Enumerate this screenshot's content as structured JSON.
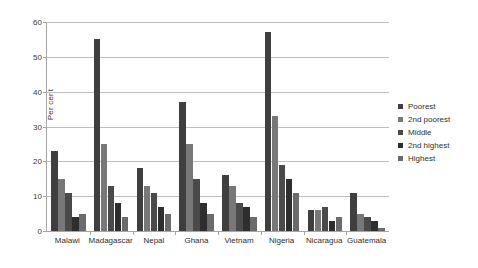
{
  "chart_data": {
    "type": "bar",
    "title": "",
    "xlabel": "",
    "ylabel": "Per cent",
    "ylim": [
      0,
      60
    ],
    "yticks": [
      0,
      10,
      20,
      30,
      40,
      50,
      60
    ],
    "grid": true,
    "legend_position": "right",
    "categories": [
      "Malawi",
      "Madagascar",
      "Nepal",
      "Ghana",
      "Vietnam",
      "Nigeria",
      "Nicaragua",
      "Guatemala"
    ],
    "series": [
      {
        "name": "Poorest",
        "color": "#3f3f3f",
        "values": [
          23,
          55,
          18,
          37,
          16,
          57,
          6,
          11
        ]
      },
      {
        "name": "2nd poorest",
        "color": "#787878",
        "values": [
          15,
          25,
          13,
          25,
          13,
          33,
          6,
          5
        ]
      },
      {
        "name": "Middle",
        "color": "#4a4a4a",
        "values": [
          11,
          13,
          11,
          15,
          8,
          19,
          7,
          4
        ]
      },
      {
        "name": "2nd highest",
        "color": "#2e2e2e",
        "values": [
          4,
          8,
          7,
          8,
          7,
          15,
          3,
          3
        ]
      },
      {
        "name": "Highest",
        "color": "#6b6b6b",
        "values": [
          5,
          4,
          5,
          5,
          4,
          11,
          4,
          1
        ]
      }
    ]
  }
}
